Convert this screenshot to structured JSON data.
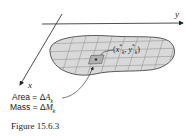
{
  "diagram": {
    "axes": {
      "x_label": "x",
      "y_label": "y"
    },
    "point_label": {
      "open": "(",
      "x": "x",
      "x_sup": "*",
      "x_sub": "k",
      "sep": ", ",
      "y": "y",
      "y_sup": "*",
      "y_sub": "k",
      "close": ")"
    },
    "annotations": {
      "area_prefix": "Area = Δ",
      "area_var": "A",
      "area_sub": "k",
      "mass_prefix": "Mass = Δ",
      "mass_var": "M",
      "mass_sub": "k"
    },
    "caption": "Figure 15.6.3",
    "colors": {
      "region_fill": "#d9d9d9",
      "grid": "#8a8a8a",
      "highlight": "#b0b0b0",
      "outline": "#333333"
    }
  }
}
